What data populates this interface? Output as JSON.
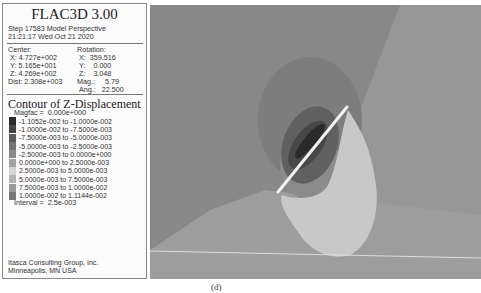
{
  "panel": {
    "app_title": "FLAC3D 3.00",
    "step_line": "Step 17583  Model Perspective",
    "time_line": "21:21:17 Wed Oct 21 2020",
    "center": {
      "label": "Center:",
      "x": "X: 4.727e+002",
      "y": "Y: 5.165e+001",
      "z": "Z: 4.269e+002",
      "dist": "Dist: 2.308e+003"
    },
    "rotation": {
      "label": "Rotation:",
      "x": "X:  359.516",
      "y": "Y:    0.000",
      "z": "Z:    3.048",
      "mag": "Mag.:     5.79",
      "ang": "Ang.:   22.500"
    },
    "contour_title": "Contour of Z-Displacement",
    "magfac": "Magfac =  0.000e+000",
    "legend": [
      {
        "label": "-1.1052e-002 to -1.0000e-002",
        "color": "#2a2a2a"
      },
      {
        "label": "-1.0000e-002 to -7.5000e-003",
        "color": "#454545"
      },
      {
        "label": "-7.5000e-003 to -5.0000e-003",
        "color": "#5c5c5c"
      },
      {
        "label": "-5.0000e-003 to -2.5000e-003",
        "color": "#747474"
      },
      {
        "label": "-2.5000e-003 to  0.0000e+000",
        "color": "#8a8a8a"
      },
      {
        "label": " 0.0000e+000 to  2.5000e-003",
        "color": "#a2a2a2"
      },
      {
        "label": " 2.5000e-003 to  5.0000e-003",
        "color": "#d4d4d4"
      },
      {
        "label": " 5.0000e-003 to  7.5000e-003",
        "color": "#b4b4b4"
      },
      {
        "label": " 7.5000e-003 to  1.0000e-002",
        "color": "#9a9a9a"
      },
      {
        "label": " 1.0000e-002 to  1.1144e-002",
        "color": "#777777"
      }
    ],
    "interval": "Interval =  2.5e-003",
    "footer_line1": "Itasca Consulting Group, Inc.",
    "footer_line2": "Minneapolis, MN  USA"
  },
  "plot": {
    "colors": {
      "background_left": "#878787",
      "background_right": "#999999",
      "lower_band": "#a0a0a0",
      "halo": "#7b7b7b",
      "dark_lobe": "#5f5f5f",
      "darker_lobe": "#484848",
      "darkest_core": "#2c2c2c",
      "light_lobe": "#c6c6c6",
      "mid_lobe": "#8e8e8e",
      "fault_line": "#f4f4f0",
      "horizon_line": "#d8d8d8"
    }
  },
  "caption": "(d)"
}
